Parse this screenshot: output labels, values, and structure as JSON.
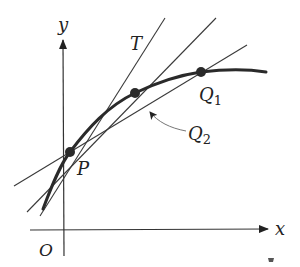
{
  "diagram": {
    "labels": {
      "y_axis": "y",
      "x_axis": "x",
      "origin": "O",
      "tangent": "T",
      "point_p": "P",
      "point_q1": "Q",
      "point_q1_sub": "1",
      "point_q2": "Q",
      "point_q2_sub": "2"
    },
    "colors": {
      "stroke": "#2a2a2a",
      "thin_line": "#4a4a4a",
      "leader": "#777777",
      "background": "#ffffff"
    },
    "points": [
      {
        "name": "P",
        "x": 70,
        "y": 152
      },
      {
        "name": "Q2",
        "x": 135,
        "y": 93
      },
      {
        "name": "Q1",
        "x": 201,
        "y": 72
      }
    ],
    "lines": [
      {
        "name": "tangent-T",
        "from": [
          40,
          216
        ],
        "to": [
          165,
          18
        ]
      },
      {
        "name": "secant-PQ2",
        "from": [
          27,
          212
        ],
        "to": [
          216,
          18
        ]
      },
      {
        "name": "secant-PQ1",
        "from": [
          14,
          186
        ],
        "to": [
          247,
          45
        ]
      }
    ]
  }
}
